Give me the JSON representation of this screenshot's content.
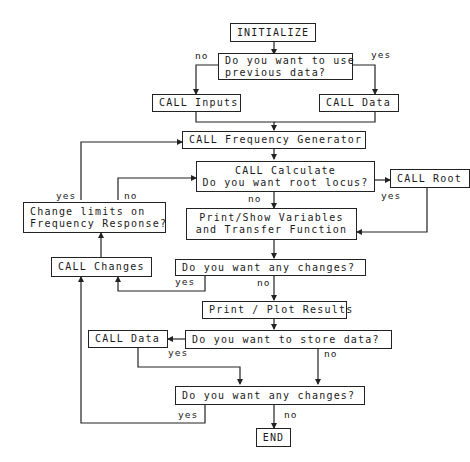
{
  "flowchart": {
    "nodes": {
      "initialize": "INITIALIZE",
      "q_previous_line1": "Do you want to use",
      "q_previous_line2": "previous data?",
      "call_inputs": "CALL Inputs",
      "call_data_top": "CALL Data",
      "call_freq_gen": "CALL Frequency Generator",
      "call_calculate_line1": "CALL Calculate",
      "call_calculate_line2": "Do you want root locus?",
      "call_root": "CALL Root",
      "change_limits_line1": "Change limits on",
      "change_limits_line2": "Frequency Response?",
      "print_show_line1": "Print/Show Variables",
      "print_show_line2": "and Transfer Function",
      "call_changes": "CALL Changes",
      "q_changes_1": "Do you want any changes?",
      "print_plot": "Print / Plot Results",
      "call_data_bottom": "CALL Data",
      "q_store": "Do you want to store data?",
      "q_changes_2": "Do you want any changes?",
      "end": "END"
    },
    "labels": {
      "previous_no": "no",
      "previous_yes": "yes",
      "limits_yes": "yes",
      "limits_no": "no",
      "root_no": "no",
      "root_yes": "yes",
      "changes1_yes": "yes",
      "changes1_no": "no",
      "store_yes": "yes",
      "store_no": "no",
      "changes2_yes": "yes",
      "changes2_no": "no"
    },
    "line_color": "#222222"
  }
}
